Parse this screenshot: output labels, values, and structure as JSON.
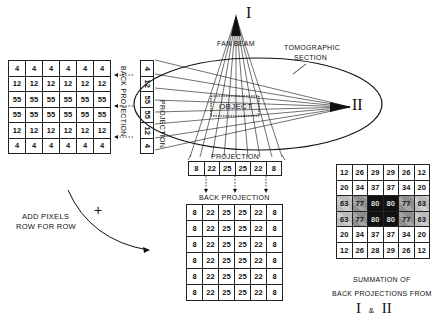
{
  "labels": {
    "source_one": "I",
    "source_two": "II",
    "fan_beam": "FAN BEAM",
    "tomographic_section": "TOMOGRAPHIC SECTION",
    "tomographic_line1": "TOMOGRAPHIC",
    "tomographic_line2": "SECTION",
    "object": "OBJECT",
    "projection_side": "PROJECTION",
    "projection_bottom": "PROJECTION",
    "back_projection_side": "BACK PROJECTION",
    "back_projection_bottom": "BACK PROJECTION",
    "add_pixels_line1": "ADD PIXELS",
    "add_pixels_line2": "ROW FOR ROW",
    "plus": "+",
    "summation_line1": "SUMMATION OF",
    "summation_line2": "BACK PROJECTIONS FROM",
    "summation_line3_a": "I",
    "summation_line3_amp": "&",
    "summation_line3_b": "II"
  },
  "side_projection": {
    "values": [
      4,
      12,
      55,
      55,
      12,
      4
    ]
  },
  "side_back_projection_grid": {
    "rows": [
      [
        4,
        4,
        4,
        4,
        4,
        4
      ],
      [
        12,
        12,
        12,
        12,
        12,
        12
      ],
      [
        55,
        55,
        55,
        55,
        55,
        55
      ],
      [
        55,
        55,
        55,
        55,
        55,
        55
      ],
      [
        12,
        12,
        12,
        12,
        12,
        12
      ],
      [
        4,
        4,
        4,
        4,
        4,
        4
      ]
    ]
  },
  "bottom_projection": {
    "values": [
      8,
      22,
      25,
      25,
      22,
      8
    ]
  },
  "bottom_back_projection_grid": {
    "rows": [
      [
        8,
        22,
        25,
        25,
        22,
        8
      ],
      [
        8,
        22,
        25,
        25,
        22,
        8
      ],
      [
        8,
        22,
        25,
        25,
        22,
        8
      ],
      [
        8,
        22,
        25,
        25,
        22,
        8
      ],
      [
        8,
        22,
        25,
        25,
        22,
        8
      ],
      [
        8,
        22,
        25,
        25,
        22,
        8
      ]
    ]
  },
  "summation_grid": {
    "rows": [
      [
        12,
        26,
        29,
        29,
        26,
        12
      ],
      [
        20,
        34,
        37,
        37,
        34,
        20
      ],
      [
        63,
        77,
        80,
        80,
        77,
        63
      ],
      [
        63,
        77,
        80,
        80,
        77,
        63
      ],
      [
        20,
        34,
        37,
        37,
        34,
        20
      ],
      [
        12,
        26,
        28,
        29,
        26,
        12
      ]
    ]
  }
}
